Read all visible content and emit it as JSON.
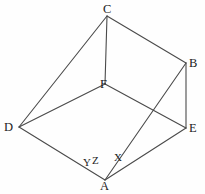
{
  "figure": {
    "kind": "geometry-line-diagram",
    "background_color": "#fefefe",
    "line_color": "#4a4a4a",
    "text_color": "#1c1c1c",
    "width": 205,
    "height": 194,
    "vertices": [
      {
        "id": "A",
        "label": "A",
        "x": 105,
        "y": 180,
        "label_x": 100,
        "label_y": 180
      },
      {
        "id": "B",
        "label": "B",
        "x": 186,
        "y": 63,
        "label_x": 189,
        "label_y": 57
      },
      {
        "id": "C",
        "label": "C",
        "x": 107,
        "y": 16,
        "label_x": 103,
        "label_y": 3
      },
      {
        "id": "D",
        "label": "D",
        "x": 19,
        "y": 127,
        "label_x": 4,
        "label_y": 121
      },
      {
        "id": "E",
        "label": "E",
        "x": 186,
        "y": 128,
        "label_x": 189,
        "label_y": 122
      },
      {
        "id": "F",
        "label": "F",
        "x": 105,
        "y": 84,
        "label_x": 100,
        "label_y": 78
      }
    ],
    "edges": [
      {
        "id": "CF",
        "from": "C",
        "to": "F"
      },
      {
        "id": "CD",
        "from": "C",
        "to": "D"
      },
      {
        "id": "CB",
        "from": "C",
        "to": "B"
      },
      {
        "id": "FD",
        "from": "F",
        "to": "D"
      },
      {
        "id": "FE",
        "from": "F",
        "to": "E"
      },
      {
        "id": "BE",
        "from": "B",
        "to": "E"
      },
      {
        "id": "DA",
        "from": "D",
        "to": "A"
      },
      {
        "id": "AE",
        "from": "A",
        "to": "E"
      },
      {
        "id": "AB",
        "from": "A",
        "to": "B"
      }
    ],
    "angle_labels": [
      {
        "id": "X",
        "label": "X",
        "x": 114,
        "y": 152
      },
      {
        "id": "Y",
        "label": "Y",
        "x": 83,
        "y": 157
      },
      {
        "id": "Z",
        "label": "Z",
        "x": 92,
        "y": 155
      }
    ]
  }
}
